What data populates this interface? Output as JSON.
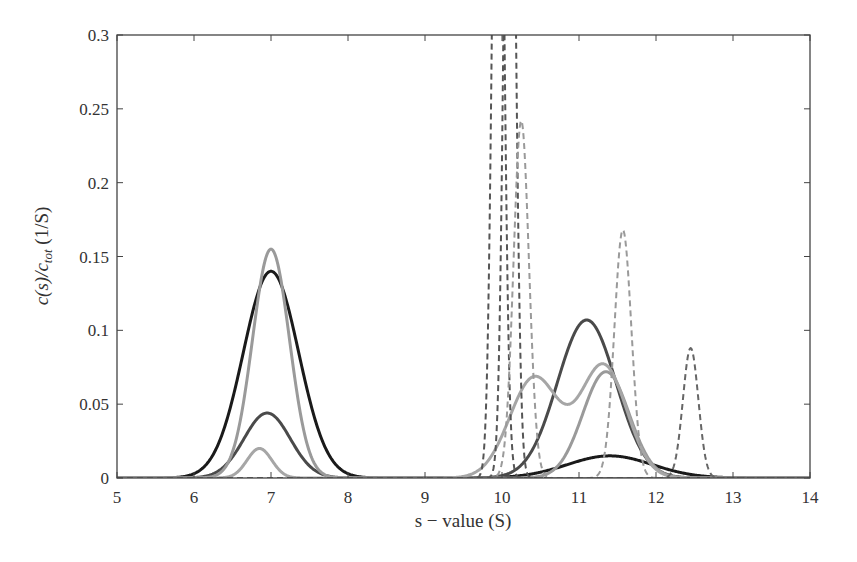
{
  "chart_data": {
    "type": "line",
    "title": "",
    "xlabel": "s − value (S)",
    "ylabel": "c(s)/c_tot (1/S)",
    "ylabel_parts": {
      "main": "c(s)/c",
      "sub": "tot",
      "unit": " (1/S)"
    },
    "xlim": [
      5,
      14
    ],
    "ylim": [
      0,
      0.3
    ],
    "xticks": [
      5,
      6,
      7,
      8,
      9,
      10,
      11,
      12,
      13,
      14
    ],
    "xtick_labels": [
      "5",
      "6",
      "7",
      "8",
      "9",
      "10",
      "11",
      "12",
      "13",
      "14"
    ],
    "yticks": [
      0,
      0.05,
      0.1,
      0.15,
      0.2,
      0.25,
      0.3
    ],
    "ytick_labels": [
      "0",
      "0.05",
      "0.1",
      "0.15",
      "0.2",
      "0.25",
      "0.3"
    ],
    "grid": false,
    "legend": null,
    "series": [
      {
        "name": "black solid",
        "color": "#1a1a1a",
        "style": "solid",
        "width": 3,
        "peaks": [
          {
            "mu": 7.0,
            "amp": 0.14,
            "sigma": 0.36
          },
          {
            "mu": 11.4,
            "amp": 0.015,
            "sigma": 0.55
          }
        ]
      },
      {
        "name": "dark gray solid",
        "color": "#4a4a4a",
        "style": "solid",
        "width": 3,
        "peaks": [
          {
            "mu": 6.95,
            "amp": 0.044,
            "sigma": 0.3
          },
          {
            "mu": 11.1,
            "amp": 0.107,
            "sigma": 0.38
          }
        ]
      },
      {
        "name": "light gray solid A",
        "color": "#9a9a9a",
        "style": "solid",
        "width": 3,
        "peaks": [
          {
            "mu": 7.0,
            "amp": 0.155,
            "sigma": 0.24
          },
          {
            "mu": 11.35,
            "amp": 0.072,
            "sigma": 0.3
          }
        ]
      },
      {
        "name": "light gray solid B",
        "color": "#a6a6a6",
        "style": "solid",
        "width": 3,
        "peaks": [
          {
            "mu": 6.85,
            "amp": 0.02,
            "sigma": 0.16
          },
          {
            "mu": 10.42,
            "amp": 0.068,
            "sigma": 0.32
          },
          {
            "mu": 11.32,
            "amp": 0.076,
            "sigma": 0.3
          }
        ]
      },
      {
        "name": "dark gray dashed 1",
        "color": "#555555",
        "style": "dashed",
        "width": 2,
        "peaks": [
          {
            "mu": 9.95,
            "amp": 0.6,
            "sigma": 0.07
          }
        ]
      },
      {
        "name": "dark gray dashed 2",
        "color": "#555555",
        "style": "dashed",
        "width": 2,
        "peaks": [
          {
            "mu": 10.1,
            "amp": 0.6,
            "sigma": 0.07
          }
        ]
      },
      {
        "name": "light gray dashed 1",
        "color": "#9a9a9a",
        "style": "dashed",
        "width": 2,
        "peaks": [
          {
            "mu": 10.25,
            "amp": 0.242,
            "sigma": 0.1
          }
        ]
      },
      {
        "name": "light gray dashed 2",
        "color": "#9a9a9a",
        "style": "dashed",
        "width": 2,
        "peaks": [
          {
            "mu": 11.57,
            "amp": 0.168,
            "sigma": 0.11
          }
        ]
      },
      {
        "name": "dark gray dashed 3",
        "color": "#666666",
        "style": "dashed",
        "width": 2,
        "peaks": [
          {
            "mu": 12.45,
            "amp": 0.088,
            "sigma": 0.1
          }
        ]
      }
    ],
    "annotations": []
  }
}
